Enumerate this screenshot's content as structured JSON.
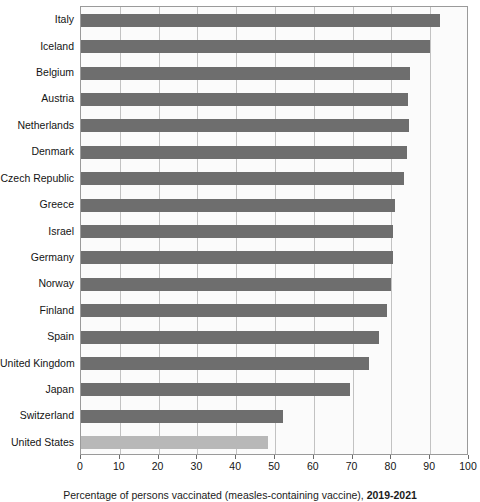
{
  "chart_data": {
    "type": "bar",
    "orientation": "horizontal",
    "title": "",
    "xlabel": "",
    "ylabel": "",
    "xlim": [
      0,
      100
    ],
    "xticks": [
      0,
      10,
      20,
      30,
      40,
      50,
      60,
      70,
      80,
      90,
      100
    ],
    "grid": true,
    "legend": false,
    "categories": [
      "Italy",
      "Iceland",
      "Belgium",
      "Austria",
      "Netherlands",
      "Denmark",
      "Czech Republic",
      "Greece",
      "Israel",
      "Germany",
      "Norway",
      "Finland",
      "Spain",
      "United Kingdom",
      "Japan",
      "Switzerland",
      "United States"
    ],
    "values": [
      92.5,
      90.0,
      84.8,
      84.3,
      84.5,
      84.0,
      83.2,
      81.0,
      80.5,
      80.5,
      79.9,
      78.8,
      76.9,
      74.3,
      69.3,
      52.0,
      48.3
    ],
    "highlight_category": "United States",
    "colors": {
      "bar": "#6e6e6e",
      "bar_highlight": "#b8b8b8",
      "plot_background": "#fbfbfb",
      "gridline": "#c2c2c2",
      "axis": "#9a9a9a",
      "text": "#141414"
    }
  },
  "caption": {
    "text": "Percentage of persons vaccinated (measles-containing vaccine), ",
    "bold_suffix": "2019-2021"
  }
}
